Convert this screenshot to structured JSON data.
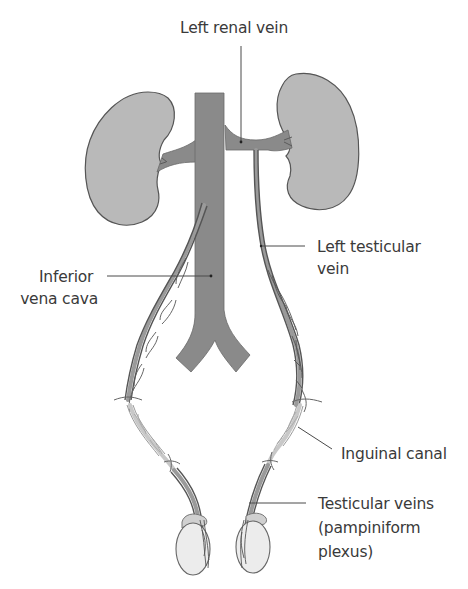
{
  "figure": {
    "type": "anatomical-diagram",
    "colors": {
      "background": "#ffffff",
      "kidney": "#b9b9b9",
      "vena_cava": "#8a8a8a",
      "vein_outline": "#555555",
      "inguinal_segment": "#c8c8c8",
      "testis": "#ececec",
      "label_text": "#3a3a3a"
    }
  },
  "labels": {
    "left_renal_vein": "Left renal vein",
    "left_testicular_vein": [
      "Left testicular",
      "vein"
    ],
    "inferior_vena_cava": [
      "Inferior",
      "vena cava"
    ],
    "inguinal_canal": "Inguinal canal",
    "testicular_veins": [
      "Testicular veins",
      "(pampiniform",
      "plexus)"
    ]
  },
  "structures": [
    {
      "name": "right-kidney"
    },
    {
      "name": "left-kidney"
    },
    {
      "name": "inferior-vena-cava"
    },
    {
      "name": "left-renal-vein"
    },
    {
      "name": "right-renal-vein"
    },
    {
      "name": "right-testicular-vein"
    },
    {
      "name": "left-testicular-vein"
    },
    {
      "name": "right-inguinal-canal"
    },
    {
      "name": "left-inguinal-canal"
    },
    {
      "name": "right-testis"
    },
    {
      "name": "left-testis"
    }
  ]
}
